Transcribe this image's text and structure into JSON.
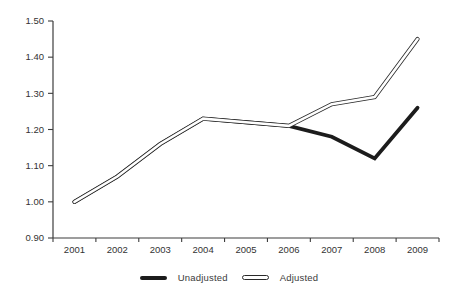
{
  "chart_data": {
    "type": "line",
    "title": "",
    "categories": [
      "2001",
      "2002",
      "2003",
      "2004",
      "2005",
      "2006",
      "2007",
      "2008",
      "2009"
    ],
    "series": [
      {
        "name": "Unadjusted",
        "style": "solid-thick",
        "values": [
          1.0,
          1.07,
          1.16,
          1.23,
          1.22,
          1.21,
          1.18,
          1.12,
          1.26
        ]
      },
      {
        "name": "Adjusted",
        "style": "outlined-white",
        "values": [
          1.0,
          1.07,
          1.16,
          1.23,
          1.22,
          1.21,
          1.27,
          1.29,
          1.45
        ]
      }
    ],
    "ylim": [
      0.9,
      1.5
    ],
    "yticks": [
      {
        "v": 0.9,
        "label": "0.90"
      },
      {
        "v": 1.0,
        "label": "1.00"
      },
      {
        "v": 1.1,
        "label": "1.10"
      },
      {
        "v": 1.2,
        "label": "1.20"
      },
      {
        "v": 1.3,
        "label": "1.30"
      },
      {
        "v": 1.4,
        "label": "1.40"
      },
      {
        "v": 1.5,
        "label": "1.50"
      }
    ],
    "xlabel": "",
    "ylabel": "",
    "grid": false,
    "legend_position": "bottom"
  },
  "colors": {
    "background": "#ffffff",
    "axis": "#3d3d3d",
    "tick_text": "#333333",
    "line_unadjusted": "#1c1c1c",
    "line_adjusted_border": "#2a2a2a",
    "line_adjusted_fill": "#ffffff"
  }
}
